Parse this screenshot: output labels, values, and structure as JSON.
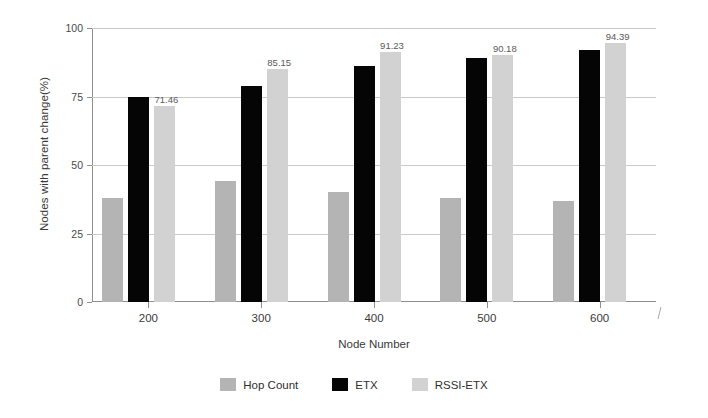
{
  "chart_data": {
    "type": "bar",
    "title": "",
    "xlabel": "Node Number",
    "ylabel": "Nodes with parent change(%)",
    "categories": [
      "200",
      "300",
      "400",
      "500",
      "600"
    ],
    "ylim": [
      0,
      100
    ],
    "yticks": [
      "0",
      "25",
      "50",
      "75",
      "100"
    ],
    "ytick_values": [
      0,
      25,
      50,
      75,
      100
    ],
    "grid": true,
    "legend_position": "bottom",
    "series": [
      {
        "name": "Hop Count",
        "color": "#b4b4b4",
        "values": [
          38,
          44,
          40,
          38,
          37
        ],
        "labels": [
          "",
          "",
          "",
          "",
          ""
        ]
      },
      {
        "name": "ETX",
        "color": "#050505",
        "values": [
          75,
          79,
          86,
          89,
          92
        ],
        "labels": [
          "",
          "",
          "",
          "",
          ""
        ]
      },
      {
        "name": "RSSI-ETX",
        "color": "#d2d2d2",
        "values": [
          71.46,
          85.15,
          91.23,
          90.18,
          94.39
        ],
        "labels": [
          "71.46",
          "85.15",
          "91.23",
          "90.18",
          "94.39"
        ]
      }
    ]
  }
}
